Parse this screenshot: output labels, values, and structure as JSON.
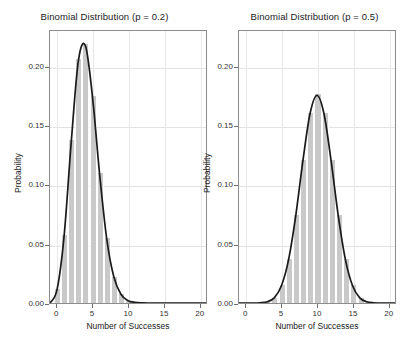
{
  "figure": {
    "background": "#ffffff",
    "bar_color": "#c9c9c9",
    "curve_color": "#1a1a1a",
    "grid_color": "#e3e3e3",
    "frame_color": "#8c8c8c"
  },
  "chart_data": [
    {
      "type": "bar",
      "title": "Binomial Distribution (p = 0.2)",
      "xlabel": "Number of Successes",
      "ylabel": "Probability",
      "xlim": [
        -1,
        21
      ],
      "ylim": [
        0,
        0.2308
      ],
      "grid": true,
      "legend": "none",
      "xticks": [
        0,
        5,
        10,
        15,
        20
      ],
      "xticklabels": [
        "0",
        "5",
        "10",
        "15",
        "20"
      ],
      "yticks": [
        0.0,
        0.05,
        0.1,
        0.15,
        0.2
      ],
      "yticklabels": [
        "0.00",
        "0.05",
        "0.10",
        "0.15",
        "0.20"
      ],
      "n": 20,
      "p": 0.2,
      "categories": [
        0,
        1,
        2,
        3,
        4,
        5,
        6,
        7,
        8,
        9,
        10,
        11,
        12,
        13,
        14,
        15,
        16,
        17,
        18,
        19,
        20
      ],
      "values": [
        0.0115,
        0.0576,
        0.1369,
        0.2054,
        0.2182,
        0.1746,
        0.1091,
        0.0545,
        0.0222,
        0.0074,
        0.002,
        0.0005,
        0.0001,
        0.0,
        0.0,
        0.0,
        0.0,
        0.0,
        0.0,
        0.0,
        0.0
      ],
      "overlay_curve": {
        "name": "smoothed density",
        "x": [
          -1,
          0,
          1,
          2,
          3,
          4,
          5,
          6,
          7,
          8,
          9,
          10,
          11,
          12,
          13,
          14,
          15,
          16,
          17,
          18,
          19,
          20,
          21
        ],
        "y": [
          0.0,
          0.0115,
          0.0576,
          0.1369,
          0.2054,
          0.2182,
          0.1746,
          0.1091,
          0.0545,
          0.0222,
          0.0074,
          0.002,
          0.0005,
          0.0001,
          0.0,
          0.0,
          0.0,
          0.0,
          0.0,
          0.0,
          0.0,
          0.0,
          0.0
        ]
      }
    },
    {
      "type": "bar",
      "title": "Binomial Distribution (p = 0.5)",
      "xlabel": "Number of Successes",
      "ylabel": "Probability",
      "xlim": [
        -1,
        21
      ],
      "ylim": [
        0,
        0.2308
      ],
      "grid": true,
      "legend": "none",
      "xticks": [
        0,
        5,
        10,
        15,
        20
      ],
      "xticklabels": [
        "0",
        "5",
        "10",
        "15",
        "20"
      ],
      "yticks": [
        0.0,
        0.05,
        0.1,
        0.15,
        0.2
      ],
      "yticklabels": [
        "0.00",
        "0.05",
        "0.10",
        "0.15",
        "0.20"
      ],
      "n": 20,
      "p": 0.5,
      "categories": [
        0,
        1,
        2,
        3,
        4,
        5,
        6,
        7,
        8,
        9,
        10,
        11,
        12,
        13,
        14,
        15,
        16,
        17,
        18,
        19,
        20
      ],
      "values": [
        0.0,
        0.0,
        0.0002,
        0.0011,
        0.0046,
        0.0148,
        0.037,
        0.0739,
        0.1201,
        0.1602,
        0.1762,
        0.1602,
        0.1201,
        0.0739,
        0.037,
        0.0148,
        0.0046,
        0.0011,
        0.0002,
        0.0,
        0.0
      ],
      "overlay_curve": {
        "name": "smoothed density",
        "x": [
          -1,
          0,
          1,
          2,
          3,
          4,
          5,
          6,
          7,
          8,
          9,
          10,
          11,
          12,
          13,
          14,
          15,
          16,
          17,
          18,
          19,
          20,
          21
        ],
        "y": [
          0.0,
          0.0,
          0.0,
          0.0002,
          0.0011,
          0.0046,
          0.0148,
          0.037,
          0.0739,
          0.1201,
          0.1602,
          0.1762,
          0.1602,
          0.1201,
          0.0739,
          0.037,
          0.0148,
          0.0046,
          0.0011,
          0.0002,
          0.0,
          0.0,
          0.0
        ]
      }
    }
  ]
}
